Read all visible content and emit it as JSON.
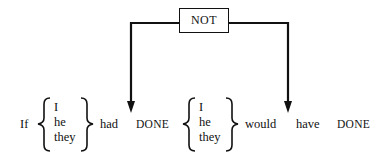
{
  "diagram": {
    "operator_label": "NOT",
    "sentence": {
      "if": "If",
      "subjects_1": [
        "I",
        "he",
        "they"
      ],
      "had": "had",
      "done_1": "DONE",
      "subjects_2": [
        "I",
        "he",
        "they"
      ],
      "would": "would",
      "have": "have",
      "done_2": "DONE"
    },
    "arrows": [
      {
        "from": "NOT",
        "to": "between had and DONE"
      },
      {
        "from": "NOT",
        "to": "between would and have"
      }
    ],
    "line_color": "#111111"
  }
}
